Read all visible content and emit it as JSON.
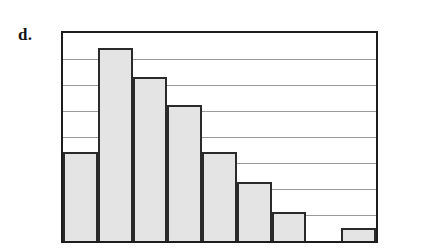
{
  "figure": {
    "part_label": "d.",
    "caption": "",
    "colors": {
      "bar_fill": "#e4e4e4",
      "bar_stroke": "#2a2a2a",
      "frame_stroke": "#1d1d1d",
      "gridline": "#9a9a9a",
      "background": "#ffffff",
      "label_text": "#141414"
    }
  },
  "chart_data": {
    "type": "bar",
    "title": "",
    "subtitle": "",
    "xlabel": "",
    "ylabel": "",
    "categories": [
      "1",
      "2",
      "3",
      "4",
      "5",
      "6",
      "7",
      "8",
      "9"
    ],
    "values": [
      3.44,
      7.44,
      6.3,
      5.25,
      3.44,
      2.26,
      1.13,
      0,
      0.49
    ],
    "tick_labels": {
      "x": [],
      "y": []
    },
    "ylim": [
      0,
      8
    ],
    "xlim": [
      0,
      9
    ],
    "grid": true,
    "gridlines_y": [
      1,
      2,
      3,
      4,
      5,
      6,
      7
    ],
    "legend": false,
    "legend_position": "none",
    "annotations": []
  }
}
